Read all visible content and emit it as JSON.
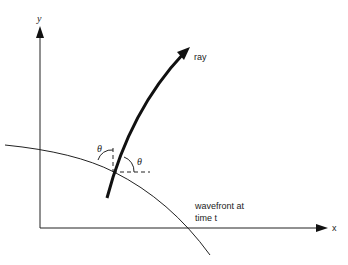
{
  "diagram": {
    "axes": {
      "x_label": "x",
      "y_label": "y"
    },
    "ray_label": "ray",
    "wavefront_label_line1": "wavefront at",
    "wavefront_label_line2": "time t",
    "angle_label_left": "θ",
    "angle_label_right": "θ",
    "colors": {
      "ink": "#111111",
      "background": "#ffffff"
    }
  }
}
